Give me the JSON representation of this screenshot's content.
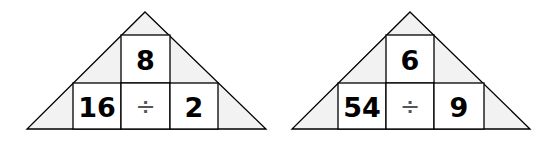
{
  "colors": {
    "stroke": "#000000",
    "shade": "#f2f2f2",
    "box": "#ffffff",
    "text": "#000000",
    "operator": "#555555"
  },
  "puzzles": [
    {
      "apex": [
        145,
        12
      ],
      "base_left": [
        27,
        129
      ],
      "base_right": [
        266,
        129
      ],
      "top_box": {
        "x": 121,
        "y": 35,
        "w": 49,
        "h": 48,
        "value": "8"
      },
      "bottom_boxes": [
        {
          "x": 73,
          "y": 83,
          "w": 48,
          "h": 46,
          "value": "16"
        },
        {
          "x": 121,
          "y": 83,
          "w": 49,
          "h": 46,
          "value": "÷",
          "kind": "operator"
        },
        {
          "x": 170,
          "y": 83,
          "w": 48,
          "h": 46,
          "value": "2"
        }
      ]
    },
    {
      "apex": [
        410,
        12
      ],
      "base_left": [
        292,
        129
      ],
      "base_right": [
        530,
        129
      ],
      "top_box": {
        "x": 386,
        "y": 35,
        "w": 48,
        "h": 48,
        "value": "6"
      },
      "bottom_boxes": [
        {
          "x": 338,
          "y": 83,
          "w": 48,
          "h": 46,
          "value": "54"
        },
        {
          "x": 386,
          "y": 83,
          "w": 48,
          "h": 46,
          "value": "÷",
          "kind": "operator"
        },
        {
          "x": 434,
          "y": 83,
          "w": 50,
          "h": 46,
          "value": "9"
        }
      ]
    }
  ]
}
